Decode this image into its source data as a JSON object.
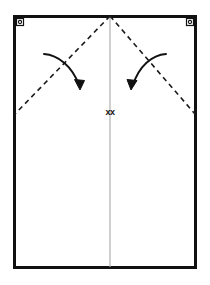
{
  "diagram": {
    "type": "instructional-fold-diagram",
    "colors": {
      "background": "#ffffff",
      "outline": "#111111",
      "fold_guide": "#1a1a1a",
      "center_fold": "#b0b0b0",
      "arrow": "#111111",
      "grommet": "#111111"
    },
    "panel": {
      "label": "panel-outline",
      "x": 13,
      "y": 15,
      "width": 184,
      "height": 254,
      "stroke_width": 3
    },
    "center_fold_line": {
      "label": "center fold line",
      "x": 110,
      "y_top": 16,
      "y_bottom": 268,
      "stroke_width": 1.2
    },
    "fold_guides": [
      {
        "label": "left diagonal fold guide",
        "from_x": 110,
        "from_y": 16,
        "to_x": 14,
        "to_y": 114,
        "dash": "5 4",
        "stroke_width": 1.6
      },
      {
        "label": "right diagonal fold guide",
        "from_x": 110,
        "from_y": 16,
        "to_x": 196,
        "to_y": 114,
        "dash": "5 4",
        "stroke_width": 1.6
      }
    ],
    "arrows": [
      {
        "label": "left fold direction arrow",
        "start_x": 44,
        "start_y": 54,
        "end_x": 79,
        "end_y": 86,
        "direction": "down-right",
        "stroke_width": 1.8
      },
      {
        "label": "right fold direction arrow",
        "start_x": 166,
        "start_y": 54,
        "end_x": 133,
        "end_y": 86,
        "direction": "down-left",
        "stroke_width": 1.8
      }
    ],
    "grommets": [
      {
        "label": "top-left grommet",
        "cx": 20,
        "cy": 22,
        "outer_r": 3.6,
        "inner_r": 1.5
      },
      {
        "label": "top-right grommet",
        "cx": 190,
        "cy": 22,
        "outer_r": 3.6,
        "inner_r": 1.5
      }
    ],
    "center_mark": {
      "label": "center mark",
      "text": "xx",
      "x": 110,
      "y": 113
    }
  }
}
